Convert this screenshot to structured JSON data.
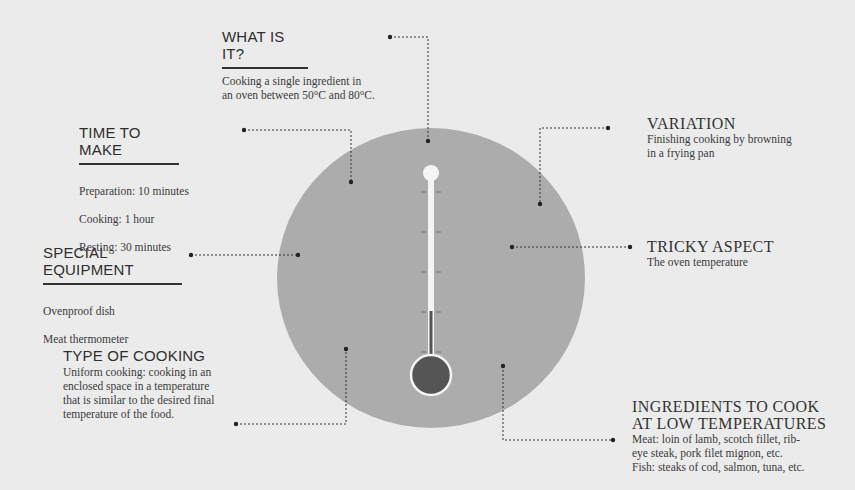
{
  "sections": {
    "what_is_it": {
      "title": "WHAT IS IT?",
      "body": "Cooking a single ingredient in\nan oven between 50°C and 80°C."
    },
    "time_to_make": {
      "title": "TIME TO MAKE",
      "lines": [
        "Preparation: 10 minutes",
        "Cooking: 1 hour",
        "Resting: 30 minutes"
      ]
    },
    "special_equipment": {
      "title": "SPECIAL EQUIPMENT",
      "lines": [
        "Ovenproof dish",
        "Meat thermometer"
      ]
    },
    "type_of_cooking": {
      "title": "TYPE OF COOKING",
      "body": "Uniform cooking: cooking in an\nenclosed space in a temperature\nthat is similar to the desired final\ntemperature of the food."
    },
    "variation": {
      "title": "VARIATION",
      "body": "Finishing cooking by browning\nin a frying pan"
    },
    "tricky_aspect": {
      "title": "TRICKY ASPECT",
      "body": "The oven temperature"
    },
    "ingredients": {
      "title_line1": "INGREDIENTS TO COOK",
      "title_line2": "AT LOW TEMPERATURES",
      "body": "Meat: loin of lamb, scotch fillet, rib-\neye steak, pork filet mignon, etc.\nFish: steaks of cod, salmon, tuna, etc."
    }
  },
  "graphic": {
    "icon": "thermometer-icon",
    "circle_color": "#acacac",
    "background_color": "#ebebeb",
    "mercury_color": "#555555",
    "tube_color": "#f4f4f4",
    "tick_count": 5
  }
}
